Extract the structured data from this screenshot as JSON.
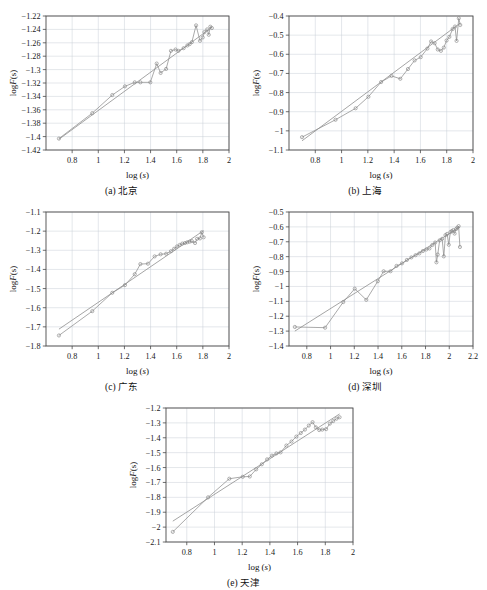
{
  "figure": {
    "width": 487,
    "height": 590,
    "background": "#ffffff",
    "line_color": "#8e8e8e",
    "marker_color": "#7d7d7d",
    "grid_color": "#c9cfd6",
    "axis_color": "#4a4a4a"
  },
  "labels": {
    "xlabel_prefix": "log (",
    "xlabel_var": "s",
    "xlabel_suffix": ")",
    "ylabel_prefix": "log",
    "ylabel_var": "F",
    "ylabel_suffix": "(s)",
    "xlabel_full": "log (s)",
    "ylabel_full": "logF(s)"
  },
  "chart_data": [
    {
      "id": "panel-a",
      "type": "scatter",
      "panel_label": "(a)",
      "region": "北京",
      "caption": "(a) 北京",
      "title": "",
      "xlabel": "log (s)",
      "ylabel": "logF(s)",
      "xlim": [
        0.6,
        2.0
      ],
      "ylim": [
        -1.42,
        -1.22
      ],
      "xticks": [
        0.8,
        1,
        1.2,
        1.4,
        1.6,
        1.8,
        2
      ],
      "xtick_labels": [
        "0.8",
        "1",
        "1.2",
        "1.4",
        "1.6",
        "1.8",
        "2"
      ],
      "yticks": [
        -1.42,
        -1.4,
        -1.38,
        -1.36,
        -1.34,
        -1.32,
        -1.3,
        -1.28,
        -1.26,
        -1.24,
        -1.22
      ],
      "ytick_labels": [
        "-1.42",
        "-1.4",
        "-1.38",
        "-1.36",
        "-1.34",
        "-1.32",
        "-1.3",
        "-1.28",
        "-1.26",
        "-1.24",
        "-1.22"
      ],
      "grid": true,
      "legend": "none",
      "series": [
        {
          "name": "data",
          "marker": "circle",
          "x": [
            0.699,
            0.954,
            1.107,
            1.204,
            1.279,
            1.322,
            1.398,
            1.447,
            1.477,
            1.519,
            1.556,
            1.591,
            1.613,
            1.653,
            1.681,
            1.699,
            1.716,
            1.748,
            1.778,
            1.799,
            1.812,
            1.833,
            1.845,
            1.857,
            1.869
          ],
          "y": [
            -1.403,
            -1.365,
            -1.338,
            -1.325,
            -1.319,
            -1.319,
            -1.319,
            -1.291,
            -1.305,
            -1.299,
            -1.272,
            -1.27,
            -1.272,
            -1.268,
            -1.264,
            -1.262,
            -1.259,
            -1.234,
            -1.257,
            -1.252,
            -1.244,
            -1.24,
            -1.248,
            -1.236,
            -1.238
          ]
        },
        {
          "name": "linear fit",
          "marker": "none",
          "x": [
            0.699,
            1.869
          ],
          "y": [
            -1.404,
            -1.237
          ]
        }
      ]
    },
    {
      "id": "panel-b",
      "type": "scatter",
      "panel_label": "(b)",
      "region": "上海",
      "caption": "(b) 上海",
      "title": "",
      "xlabel": "log (s)",
      "ylabel": "logF(s)",
      "xlim": [
        0.6,
        2.0
      ],
      "ylim": [
        -1.1,
        -0.4
      ],
      "xticks": [
        0.8,
        1,
        1.2,
        1.4,
        1.6,
        1.8,
        2
      ],
      "xtick_labels": [
        "0.8",
        "1",
        "1.2",
        "1.4",
        "1.6",
        "1.8",
        "2"
      ],
      "yticks": [
        -1.1,
        -1.0,
        -0.9,
        -0.8,
        -0.7,
        -0.6,
        -0.5,
        -0.4
      ],
      "ytick_labels": [
        "-1.1",
        "-1",
        "-0.9",
        "-0.8",
        "-0.7",
        "-0.6",
        "-0.5",
        "-0.4"
      ],
      "grid": true,
      "legend": "none",
      "series": [
        {
          "name": "data",
          "marker": "circle",
          "x": [
            0.699,
            0.954,
            1.107,
            1.204,
            1.301,
            1.38,
            1.447,
            1.505,
            1.556,
            1.602,
            1.653,
            1.681,
            1.708,
            1.732,
            1.756,
            1.778,
            1.799,
            1.82,
            1.845,
            1.863,
            1.875,
            1.892,
            1.903
          ],
          "y": [
            -1.033,
            -0.942,
            -0.882,
            -0.822,
            -0.745,
            -0.713,
            -0.728,
            -0.677,
            -0.632,
            -0.615,
            -0.57,
            -0.533,
            -0.542,
            -0.575,
            -0.582,
            -0.565,
            -0.528,
            -0.509,
            -0.468,
            -0.455,
            -0.53,
            -0.412,
            -0.447
          ]
        },
        {
          "name": "linear fit",
          "marker": "none",
          "x": [
            0.699,
            1.903
          ],
          "y": [
            -1.052,
            -0.437
          ]
        }
      ]
    },
    {
      "id": "panel-c",
      "type": "scatter",
      "panel_label": "(c)",
      "region": "广东",
      "caption": "(c) 广东",
      "title": "",
      "xlabel": "log (s)",
      "ylabel": "logF(s)",
      "xlim": [
        0.6,
        2.0
      ],
      "ylim": [
        -1.8,
        -1.1
      ],
      "xticks": [
        0.8,
        1,
        1.2,
        1.4,
        1.6,
        1.8,
        2
      ],
      "xtick_labels": [
        "0.8",
        "1",
        "1.2",
        "1.4",
        "1.6",
        "1.8",
        "2"
      ],
      "yticks": [
        -1.8,
        -1.7,
        -1.6,
        -1.5,
        -1.4,
        -1.3,
        -1.2,
        -1.1
      ],
      "ytick_labels": [
        "-1.8",
        "-1.7",
        "-1.6",
        "-1.5",
        "-1.4",
        "-1.3",
        "-1.2",
        "-1.1"
      ],
      "grid": true,
      "legend": "none",
      "series": [
        {
          "name": "data",
          "marker": "circle",
          "x": [
            0.699,
            0.954,
            1.107,
            1.204,
            1.279,
            1.322,
            1.38,
            1.431,
            1.477,
            1.519,
            1.556,
            1.58,
            1.602,
            1.623,
            1.643,
            1.663,
            1.681,
            1.699,
            1.716,
            1.74,
            1.756,
            1.778,
            1.792,
            1.806
          ],
          "y": [
            -1.745,
            -1.618,
            -1.522,
            -1.482,
            -1.425,
            -1.372,
            -1.37,
            -1.332,
            -1.321,
            -1.318,
            -1.305,
            -1.292,
            -1.28,
            -1.272,
            -1.265,
            -1.262,
            -1.258,
            -1.255,
            -1.252,
            -1.262,
            -1.24,
            -1.238,
            -1.206,
            -1.232
          ]
        },
        {
          "name": "linear fit",
          "marker": "none",
          "x": [
            0.699,
            1.806
          ],
          "y": [
            -1.712,
            -1.197
          ]
        }
      ]
    },
    {
      "id": "panel-d",
      "type": "scatter",
      "panel_label": "(d)",
      "region": "深圳",
      "caption": "(d) 深圳",
      "title": "",
      "xlabel": "log (s)",
      "ylabel": "logF(s)",
      "xlim": [
        0.65,
        2.2
      ],
      "ylim": [
        -1.4,
        -0.5
      ],
      "xticks": [
        0.8,
        1,
        1.2,
        1.4,
        1.6,
        1.8,
        2,
        2.2
      ],
      "xtick_labels": [
        "0.8",
        "1",
        "1.2",
        "1.4",
        "1.6",
        "1.8",
        "2",
        "2.2"
      ],
      "yticks": [
        -1.4,
        -1.3,
        -1.2,
        -1.1,
        -1.0,
        -0.9,
        -0.8,
        -0.7,
        -0.6,
        -0.5
      ],
      "ytick_labels": [
        "-1.4",
        "-1.3",
        "-1.2",
        "-1.1",
        "-1",
        "-0.9",
        "-0.8",
        "-0.7",
        "-0.6",
        "-0.5"
      ],
      "grid": true,
      "legend": "none",
      "series": [
        {
          "name": "data",
          "marker": "circle",
          "x": [
            0.699,
            0.954,
            1.107,
            1.204,
            1.301,
            1.398,
            1.447,
            1.505,
            1.556,
            1.602,
            1.643,
            1.681,
            1.716,
            1.748,
            1.778,
            1.806,
            1.833,
            1.857,
            1.881,
            1.892,
            1.903,
            1.919,
            1.94,
            1.954,
            1.968,
            1.982,
            1.996,
            2.009,
            2.021,
            2.033,
            2.045,
            2.057,
            2.068,
            2.079,
            2.09
          ],
          "y": [
            -1.272,
            -1.277,
            -1.105,
            -1.015,
            -1.09,
            -0.965,
            -0.898,
            -0.898,
            -0.862,
            -0.845,
            -0.822,
            -0.805,
            -0.79,
            -0.778,
            -0.762,
            -0.752,
            -0.745,
            -0.722,
            -0.705,
            -0.838,
            -0.786,
            -0.69,
            -0.68,
            -0.798,
            -0.655,
            -0.647,
            -0.72,
            -0.635,
            -0.628,
            -0.622,
            -0.645,
            -0.615,
            -0.605,
            -0.595,
            -0.735
          ]
        },
        {
          "name": "linear fit",
          "marker": "none",
          "x": [
            0.699,
            2.09
          ],
          "y": [
            -1.3,
            -0.6
          ]
        }
      ]
    },
    {
      "id": "panel-e",
      "type": "scatter",
      "panel_label": "(e)",
      "region": "天津",
      "caption": "(e) 天津",
      "title": "",
      "xlabel": "log (s)",
      "ylabel": "logF(s)",
      "xlim": [
        0.65,
        2.0
      ],
      "ylim": [
        -2.1,
        -1.2
      ],
      "xticks": [
        0.8,
        1,
        1.2,
        1.4,
        1.6,
        1.8,
        2
      ],
      "xtick_labels": [
        "0.8",
        "1",
        "1.2",
        "1.4",
        "1.6",
        "1.8",
        "2"
      ],
      "yticks": [
        -2.1,
        -2.0,
        -1.9,
        -1.8,
        -1.7,
        -1.6,
        -1.5,
        -1.4,
        -1.3,
        -1.2
      ],
      "ytick_labels": [
        "-2.1",
        "-2",
        "-1.9",
        "-1.8",
        "-1.7",
        "-1.6",
        "-1.5",
        "-1.4",
        "-1.3",
        "-1.2"
      ],
      "grid": true,
      "legend": "none",
      "series": [
        {
          "name": "data",
          "marker": "circle",
          "x": [
            0.699,
            0.954,
            1.107,
            1.204,
            1.255,
            1.301,
            1.342,
            1.38,
            1.415,
            1.447,
            1.477,
            1.519,
            1.556,
            1.591,
            1.623,
            1.653,
            1.681,
            1.708,
            1.732,
            1.756,
            1.778,
            1.806,
            1.833,
            1.857,
            1.881,
            1.903
          ],
          "y": [
            -2.032,
            -1.8,
            -1.675,
            -1.662,
            -1.66,
            -1.612,
            -1.578,
            -1.545,
            -1.52,
            -1.505,
            -1.498,
            -1.452,
            -1.425,
            -1.392,
            -1.368,
            -1.345,
            -1.318,
            -1.295,
            -1.33,
            -1.348,
            -1.345,
            -1.342,
            -1.305,
            -1.288,
            -1.272,
            -1.262
          ]
        },
        {
          "name": "linear fit",
          "marker": "none",
          "x": [
            0.699,
            1.903
          ],
          "y": [
            -1.96,
            -1.24
          ]
        }
      ]
    }
  ],
  "panel_positions": [
    {
      "id": "panel-a",
      "left": 0,
      "top": 2,
      "width": 243,
      "height": 196
    },
    {
      "id": "panel-b",
      "left": 243,
      "top": 2,
      "width": 244,
      "height": 196
    },
    {
      "id": "panel-c",
      "left": 0,
      "top": 198,
      "width": 243,
      "height": 196
    },
    {
      "id": "panel-d",
      "left": 243,
      "top": 198,
      "width": 244,
      "height": 196
    },
    {
      "id": "panel-e",
      "left": 120,
      "top": 394,
      "width": 247,
      "height": 196
    }
  ]
}
